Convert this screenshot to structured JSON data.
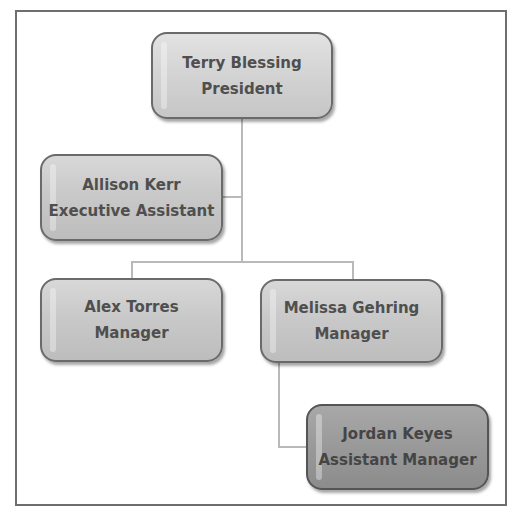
{
  "chart": {
    "type": "org-chart",
    "colors": {
      "frame_border": "#6e6e6e",
      "connector": "#b9b9b9",
      "node_fill": "#c9c9c9",
      "node_fill_top": "#d3d3d3",
      "node_fill_dark": "#999999",
      "node_border": "#6a6a6a",
      "text": "#4f4f4f"
    },
    "nodes": [
      {
        "id": "terry",
        "name": "Terry Blessing",
        "title": "President",
        "reports_to": null
      },
      {
        "id": "allison",
        "name": "Allison Kerr",
        "title": "Executive Assistant",
        "reports_to": "terry",
        "role": "assistant"
      },
      {
        "id": "alex",
        "name": "Alex Torres",
        "title": "Manager",
        "reports_to": "terry"
      },
      {
        "id": "melissa",
        "name": "Melissa Gehring",
        "title": "Manager",
        "reports_to": "terry"
      },
      {
        "id": "jordan",
        "name": "Jordan Keyes",
        "title": "Assistant Manager",
        "reports_to": "melissa"
      }
    ]
  }
}
